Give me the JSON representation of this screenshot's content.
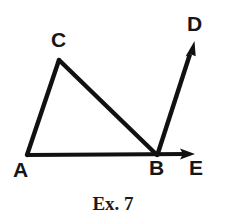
{
  "figure": {
    "caption": "Ex. 7",
    "stroke_color": "#111111",
    "background_color": "#ffffff",
    "label_color": "#161616",
    "stroke_width": 4,
    "points": {
      "A": {
        "x": 27,
        "y": 155
      },
      "B": {
        "x": 157,
        "y": 155
      },
      "C": {
        "x": 59,
        "y": 60
      },
      "D": {
        "x": 194,
        "y": 42
      },
      "E": {
        "x": 194,
        "y": 154
      }
    },
    "labels": [
      {
        "text": "A",
        "x": 13,
        "y": 159
      },
      {
        "text": "C",
        "x": 51,
        "y": 29
      },
      {
        "text": "B",
        "x": 149,
        "y": 157
      },
      {
        "text": "E",
        "x": 189,
        "y": 157
      },
      {
        "text": "D",
        "x": 187,
        "y": 13
      }
    ],
    "segments": [
      {
        "name": "segment-AC",
        "from": "A",
        "to": "C"
      },
      {
        "name": "segment-CB",
        "from": "C",
        "to": "B"
      }
    ],
    "rays": [
      {
        "name": "ray-AE",
        "from": "A",
        "to": "E"
      },
      {
        "name": "ray-BD",
        "from": "B",
        "to": "D"
      }
    ]
  }
}
